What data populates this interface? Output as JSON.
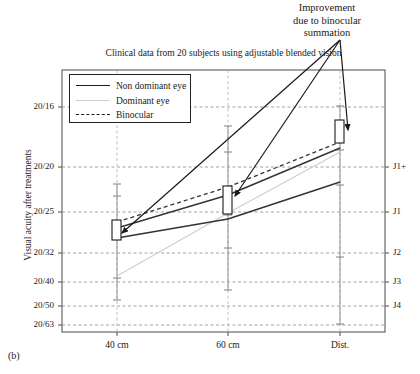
{
  "figure": {
    "panel_label": "(b)",
    "annotation": "Improvement due to binocular summation",
    "annotation_lines": [
      "Improvement",
      "due to binocular",
      "summation"
    ]
  },
  "chart_data": {
    "type": "line",
    "title": "Clinical data from 20 subjects using adjustable blended vision",
    "xlabel": "",
    "ylabel": "Visual acuity after treatments",
    "categories": [
      "40 cm",
      "60 cm",
      "Dist."
    ],
    "y_tick_labels": [
      "20/16",
      "20/20",
      "20/25",
      "20/32",
      "20/40",
      "20/50",
      "20/63"
    ],
    "y_tick_positions": [
      107,
      167,
      212,
      253,
      282,
      306,
      325
    ],
    "right_axis_label": "",
    "right_tick_labels": [
      "J1+",
      "J1",
      "J2",
      "J3",
      "J4"
    ],
    "right_tick_positions": [
      167,
      212,
      253,
      282,
      306
    ],
    "x_positions": [
      117,
      228,
      340
    ],
    "grid": true,
    "legend_position": "upper-left",
    "series": [
      {
        "name": "Non dominant eye",
        "style": "solid",
        "color": "#333333",
        "values_px": [
          228,
          195,
          148
        ],
        "values_label": [
          "20/28",
          "20/22",
          "20/18"
        ]
      },
      {
        "name": "Dominant eye",
        "style": "light",
        "color": "#cfcfcf",
        "values_px": [
          276,
          213,
          152
        ],
        "values_label": [
          "20/38",
          "20/25",
          "20/18"
        ]
      },
      {
        "name": "Binocular",
        "style": "dashed",
        "color": "#333333",
        "values_px": [
          222,
          187,
          142
        ],
        "values_label": [
          "20/27",
          "20/21",
          "20/17"
        ]
      },
      {
        "name": "Lower trace",
        "style": "solid",
        "color": "#333333",
        "values_px": [
          238,
          219,
          182
        ],
        "values_label": [
          "20/30",
          "20/26",
          "20/21"
        ]
      }
    ],
    "error_bars": [
      {
        "x_px": 117,
        "top_px": 184,
        "bottom_px": 300,
        "caps": [
          184,
          196,
          231,
          278,
          300
        ]
      },
      {
        "x_px": 228,
        "top_px": 126,
        "bottom_px": 290,
        "caps": [
          126,
          152,
          215,
          248,
          290
        ]
      },
      {
        "x_px": 340,
        "top_px": 106,
        "bottom_px": 324,
        "caps": [
          106,
          150,
          185,
          257,
          324
        ]
      }
    ],
    "markers": [
      {
        "x_px": 117,
        "top_px": 220,
        "bottom_px": 240,
        "type": "box"
      },
      {
        "x_px": 228,
        "top_px": 186,
        "bottom_px": 214,
        "type": "box"
      },
      {
        "x_px": 340,
        "top_px": 120,
        "bottom_px": 143,
        "type": "box"
      }
    ],
    "annotation_arrows": [
      {
        "from_x": 340,
        "from_y": 40,
        "to_x": 122,
        "to_y": 233
      },
      {
        "from_x": 340,
        "from_y": 40,
        "to_x": 235,
        "to_y": 196
      },
      {
        "from_x": 340,
        "from_y": 40,
        "to_x": 348,
        "to_y": 130
      }
    ],
    "plot_frame": {
      "left": 62,
      "right": 385,
      "top": 70,
      "bottom": 332
    }
  }
}
